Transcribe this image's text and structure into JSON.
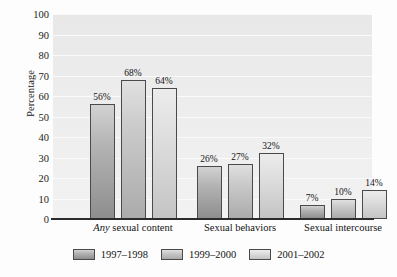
{
  "chart_data": {
    "type": "bar",
    "title": "",
    "xlabel": "",
    "ylabel": "Percentage",
    "ylim": [
      0,
      100
    ],
    "ytick_step": 10,
    "yticks": [
      100,
      90,
      80,
      70,
      60,
      50,
      40,
      30,
      20,
      10,
      0
    ],
    "ytick_labels": [
      "100",
      "90",
      "80",
      "70",
      "60",
      "50",
      "40",
      "30",
      "20",
      "10",
      "0"
    ],
    "grid": true,
    "grid_axis": "y",
    "legend_position": "bottom",
    "value_label_suffix": "%",
    "categories": [
      {
        "label_italic": "Any",
        "label_rest": " sexual content",
        "label_full": "Any sexual content"
      },
      {
        "label_italic": "",
        "label_rest": "Sexual behaviors",
        "label_full": "Sexual behaviors"
      },
      {
        "label_italic": "",
        "label_rest": "Sexual intercourse",
        "label_full": "Sexual intercourse"
      }
    ],
    "series": [
      {
        "name": "1997–1998",
        "color": "#9a9a9a",
        "values": [
          56,
          68,
          64
        ],
        "value_labels": [
          "56%",
          "68%",
          "64%"
        ]
      },
      {
        "name": "1999–2000",
        "color": "#bdbdbd",
        "values": [
          26,
          27,
          32
        ],
        "value_labels": [
          "26%",
          "27%",
          "32%"
        ]
      },
      {
        "name": "2001–2002",
        "color": "#d8d8d8",
        "values": [
          7,
          10,
          14
        ],
        "value_labels": [
          "7%",
          "10%",
          "14%"
        ]
      }
    ],
    "grouped_values": [
      {
        "category": "Any sexual content",
        "values": [
          56,
          68,
          64
        ],
        "labels": [
          "56%",
          "68%",
          "64%"
        ]
      },
      {
        "category": "Sexual behaviors",
        "values": [
          26,
          27,
          32
        ],
        "labels": [
          "26%",
          "27%",
          "32%"
        ]
      },
      {
        "category": "Sexual intercourse",
        "values": [
          7,
          10,
          14
        ],
        "labels": [
          "7%",
          "10%",
          "14%"
        ]
      }
    ],
    "legend": [
      "1997–1998",
      "1999–2000",
      "2001–2002"
    ],
    "plot_background": "#ededed",
    "gridline_color": "#fafafa",
    "axis_color": "#2b2b2b"
  }
}
